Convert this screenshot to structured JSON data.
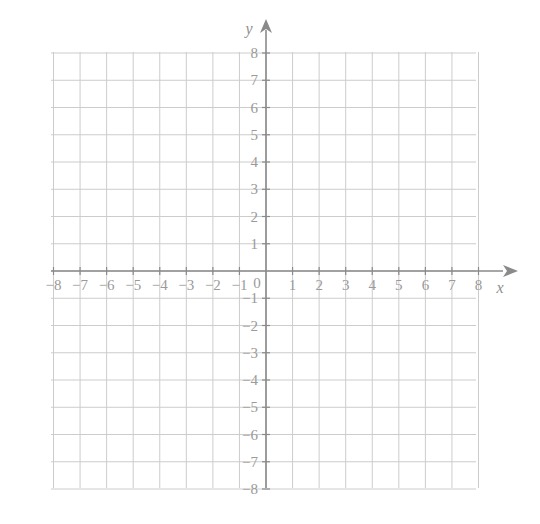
{
  "figure": {
    "kind": "cartesian-coordinate-plane",
    "background_color": "#ffffff",
    "grid_line_color": "#cccccc",
    "axis_line_color": "#8a8a8a",
    "label_color": "#9a9a9a",
    "x_axis_name": "x",
    "y_axis_name": "y",
    "origin_label": "0"
  },
  "chart_data": {
    "type": "scatter",
    "title": "",
    "subtitle": "",
    "xlabel": "x",
    "ylabel": "y",
    "xlim": [
      -8,
      8
    ],
    "ylim": [
      -8,
      8
    ],
    "x_tick_step": 1,
    "y_tick_step": 1,
    "grid": true,
    "legend": false,
    "legend_position": "none",
    "annotations": [],
    "series": [
      {
        "name": "plotted-points",
        "x": [],
        "y": []
      }
    ],
    "x_tick_labels": [
      "-8",
      "-7",
      "-6",
      "-5",
      "-4",
      "-3",
      "-2",
      "-1",
      "0",
      "1",
      "2",
      "3",
      "4",
      "5",
      "6",
      "7",
      "8"
    ],
    "y_tick_labels": [
      "-8",
      "-7",
      "-6",
      "-5",
      "-4",
      "-3",
      "-2",
      "-1",
      "0",
      "1",
      "2",
      "3",
      "4",
      "5",
      "6",
      "7",
      "8"
    ]
  },
  "x_axis": {
    "negative_labels": [
      {
        "value": -8,
        "text": "−8"
      },
      {
        "value": -7,
        "text": "−7"
      },
      {
        "value": -6,
        "text": "−6"
      },
      {
        "value": -5,
        "text": "−5"
      },
      {
        "value": -4,
        "text": "−4"
      },
      {
        "value": -3,
        "text": "−3"
      },
      {
        "value": -2,
        "text": "−2"
      },
      {
        "value": -1,
        "text": "−1"
      }
    ],
    "positive_labels": [
      {
        "value": 1,
        "text": "1"
      },
      {
        "value": 2,
        "text": "2"
      },
      {
        "value": 3,
        "text": "3"
      },
      {
        "value": 4,
        "text": "4"
      },
      {
        "value": 5,
        "text": "5"
      },
      {
        "value": 6,
        "text": "6"
      },
      {
        "value": 7,
        "text": "7"
      },
      {
        "value": 8,
        "text": "8"
      }
    ]
  },
  "y_axis": {
    "positive_labels": [
      {
        "value": 8,
        "text": "8"
      },
      {
        "value": 7,
        "text": "7"
      },
      {
        "value": 6,
        "text": "6"
      },
      {
        "value": 5,
        "text": "5"
      },
      {
        "value": 4,
        "text": "4"
      },
      {
        "value": 3,
        "text": "3"
      },
      {
        "value": 2,
        "text": "2"
      },
      {
        "value": 1,
        "text": "1"
      }
    ],
    "negative_labels": [
      {
        "value": -1,
        "text": "−1"
      },
      {
        "value": -2,
        "text": "−2"
      },
      {
        "value": -3,
        "text": "−3"
      },
      {
        "value": -4,
        "text": "−4"
      },
      {
        "value": -5,
        "text": "−5"
      },
      {
        "value": -6,
        "text": "−6"
      },
      {
        "value": -7,
        "text": "−7"
      },
      {
        "value": -8,
        "text": "−8"
      }
    ]
  }
}
